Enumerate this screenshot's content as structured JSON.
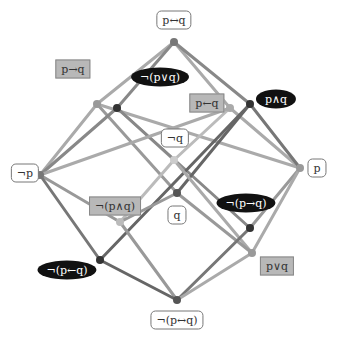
{
  "diagram": {
    "title": "",
    "nodes": [
      {
        "id": "top",
        "label": "p↔q",
        "x": 174,
        "y": 42,
        "dot_color": "#777777",
        "label_style": "white",
        "lx": 174,
        "ly": 20
      },
      {
        "id": "impl",
        "label": "p→q",
        "x": 97,
        "y": 104,
        "dot_color": "#999999",
        "label_style": "gray",
        "lx": 73,
        "ly": 69
      },
      {
        "id": "nor",
        "label": "¬(p∨q)",
        "x": 117,
        "y": 108,
        "dot_color": "#333333",
        "label_style": "black",
        "lx": 160,
        "ly": 77
      },
      {
        "id": "rimpl",
        "label": "p←q",
        "x": 230,
        "y": 108,
        "dot_color": "#aaaaaa",
        "label_style": "gray",
        "lx": 207,
        "ly": 103
      },
      {
        "id": "and",
        "label": "p∧q",
        "x": 250,
        "y": 104,
        "dot_color": "#333333",
        "label_style": "black",
        "lx": 276,
        "ly": 99
      },
      {
        "id": "notq",
        "label": "¬q",
        "x": 174,
        "y": 160,
        "dot_color": "#cccccc",
        "label_style": "white",
        "lx": 175,
        "ly": 138
      },
      {
        "id": "notp",
        "label": "¬p",
        "x": 40,
        "y": 175,
        "dot_color": "#777777",
        "label_style": "white",
        "lx": 25,
        "ly": 173
      },
      {
        "id": "p",
        "label": "p",
        "x": 300,
        "y": 168,
        "dot_color": "#999999",
        "label_style": "white",
        "lx": 317,
        "ly": 168
      },
      {
        "id": "q",
        "label": "q",
        "x": 177,
        "y": 193,
        "dot_color": "#555555",
        "label_style": "white",
        "lx": 177,
        "ly": 215
      },
      {
        "id": "nand",
        "label": "¬(p∧q)",
        "x": 120,
        "y": 222,
        "dot_color": "#bbbbbb",
        "label_style": "gray",
        "lx": 115,
        "ly": 206
      },
      {
        "id": "nimp",
        "label": "¬(p→q)",
        "x": 250,
        "y": 228,
        "dot_color": "#333333",
        "label_style": "black",
        "lx": 246,
        "ly": 203
      },
      {
        "id": "nrimp",
        "label": "¬(p←q)",
        "x": 100,
        "y": 260,
        "dot_color": "#333333",
        "label_style": "black",
        "lx": 67,
        "ly": 270
      },
      {
        "id": "or",
        "label": "p∨q",
        "x": 252,
        "y": 253,
        "dot_color": "#999999",
        "label_style": "gray",
        "lx": 277,
        "ly": 266
      },
      {
        "id": "bot",
        "label": "¬(p↔q)",
        "x": 177,
        "y": 300,
        "dot_color": "#555555",
        "label_style": "white",
        "lx": 177,
        "ly": 320
      }
    ],
    "edges": [
      {
        "from": "top",
        "to": "impl",
        "color": "#aaaaaa"
      },
      {
        "from": "top",
        "to": "nor",
        "color": "#888888"
      },
      {
        "from": "top",
        "to": "rimpl",
        "color": "#aaaaaa"
      },
      {
        "from": "top",
        "to": "and",
        "color": "#888888"
      },
      {
        "from": "impl",
        "to": "notp",
        "color": "#aaaaaa"
      },
      {
        "from": "impl",
        "to": "q",
        "color": "#999999"
      },
      {
        "from": "impl",
        "to": "p",
        "color": "#aaaaaa"
      },
      {
        "from": "nor",
        "to": "notp",
        "color": "#888888"
      },
      {
        "from": "nor",
        "to": "notq",
        "color": "#aaaaaa"
      },
      {
        "from": "nor",
        "to": "nimp",
        "color": "#888888"
      },
      {
        "from": "rimpl",
        "to": "notq",
        "color": "#bbbbbb"
      },
      {
        "from": "rimpl",
        "to": "p",
        "color": "#aaaaaa"
      },
      {
        "from": "rimpl",
        "to": "notp",
        "color": "#aaaaaa"
      },
      {
        "from": "and",
        "to": "p",
        "color": "#777777"
      },
      {
        "from": "and",
        "to": "q",
        "color": "#666666"
      },
      {
        "from": "and",
        "to": "nrimp",
        "color": "#666666"
      },
      {
        "from": "notp",
        "to": "nand",
        "color": "#999999"
      },
      {
        "from": "notp",
        "to": "nrimp",
        "color": "#777777"
      },
      {
        "from": "p",
        "to": "nimp",
        "color": "#999999"
      },
      {
        "from": "p",
        "to": "or",
        "color": "#aaaaaa"
      },
      {
        "from": "notq",
        "to": "nand",
        "color": "#bbbbbb"
      },
      {
        "from": "notq",
        "to": "or",
        "color": "#aaaaaa"
      },
      {
        "from": "q",
        "to": "nand",
        "color": "#999999"
      },
      {
        "from": "q",
        "to": "or",
        "color": "#999999"
      },
      {
        "from": "nand",
        "to": "bot",
        "color": "#999999"
      },
      {
        "from": "nimp",
        "to": "bot",
        "color": "#777777"
      },
      {
        "from": "nrimp",
        "to": "bot",
        "color": "#666666"
      },
      {
        "from": "or",
        "to": "bot",
        "color": "#aaaaaa"
      }
    ]
  }
}
